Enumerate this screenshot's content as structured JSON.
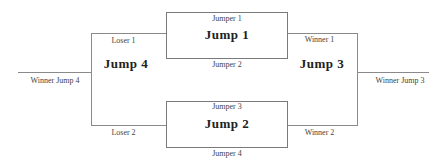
{
  "diagram": {
    "type": "tournament-bracket",
    "matches": [
      {
        "id": "jump1",
        "title": "Jump 1",
        "top": "Jumper 1",
        "bottom": "Jumper 2"
      },
      {
        "id": "jump2",
        "title": "Jump 2",
        "top": "Jumper 3",
        "bottom": "Jumper 4"
      },
      {
        "id": "jump3",
        "title": "Jump 3",
        "top": "Winner 1",
        "bottom": "Winner 2",
        "output": "Winner Jump 3"
      },
      {
        "id": "jump4",
        "title": "Jump 4",
        "top": "Loser 1",
        "bottom": "Loser 2",
        "output": "Winner Jump 4"
      }
    ],
    "colors": {
      "line": "#8a8a8a",
      "text": "#333333",
      "background": "#ffffff"
    }
  }
}
